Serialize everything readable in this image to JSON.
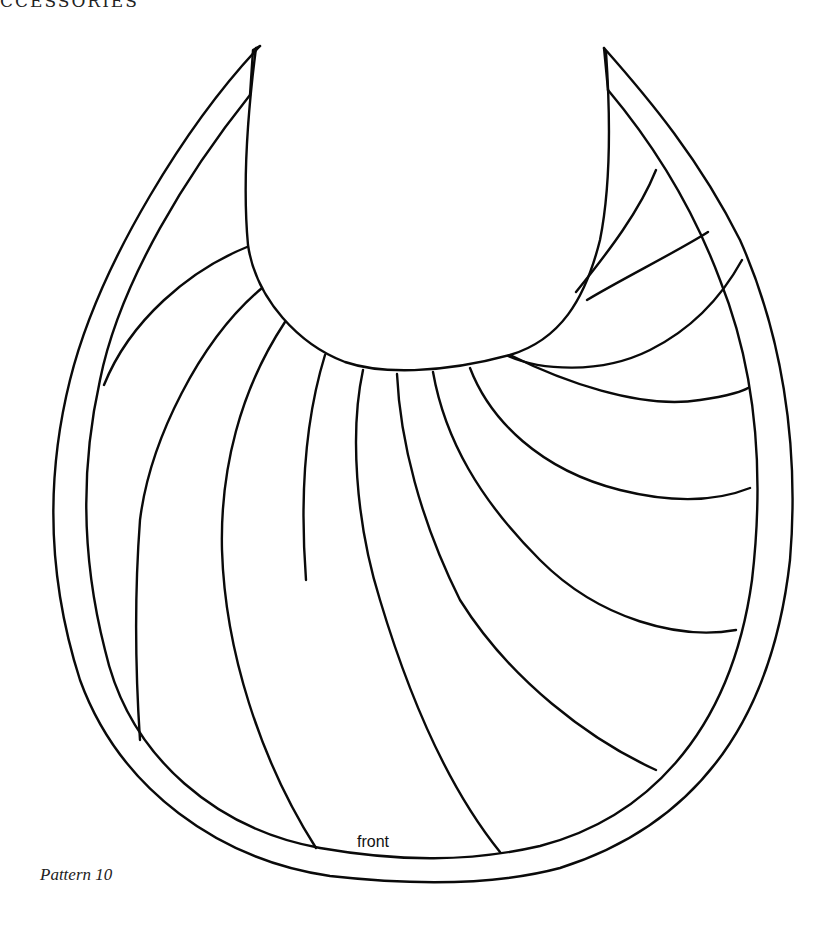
{
  "page": {
    "running_head": "CCESSORIES",
    "caption": "Pattern 10"
  },
  "pattern": {
    "name": "bib",
    "piece_label": "front",
    "stroke_color": "#0a0a0a",
    "background_color": "#ffffff"
  }
}
